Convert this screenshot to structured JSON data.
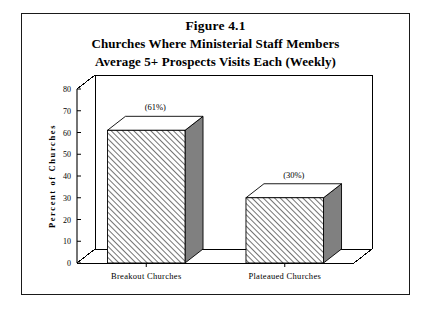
{
  "figure": {
    "title": "Figure 4.1",
    "subtitle_line1": "Churches Where Ministerial Staff Members",
    "subtitle_line2": "Average 5+ Prospects Visits Each (Weekly)"
  },
  "chart_data": {
    "type": "bar",
    "title": "Churches Where Ministerial Staff Members Average 5+ Prospects Visits Each (Weekly)",
    "categories": [
      "Breakout Churches",
      "Plateaued Churches"
    ],
    "values": [
      61,
      30
    ],
    "data_labels": [
      "(61%)",
      "(30%)"
    ],
    "xlabel": "",
    "ylabel": "Percent  of  Churches",
    "ylim": [
      0,
      80
    ],
    "ytick_step": 10,
    "yticks": [
      0,
      10,
      20,
      30,
      40,
      50,
      60,
      70,
      80
    ],
    "ytick_labels": [
      "0",
      "10",
      "20",
      "30",
      "40",
      "50",
      "60",
      "70",
      "80"
    ],
    "grid": false,
    "legend": "none",
    "style": "3d-hatched-bars",
    "colors": {
      "bar_face": "#ffffff",
      "bar_hatch": "#000000",
      "bar_side": "#808080",
      "bar_top": "#ffffff",
      "axis": "#000000",
      "border": "#1a1a1a",
      "background": "#ffffff"
    }
  }
}
